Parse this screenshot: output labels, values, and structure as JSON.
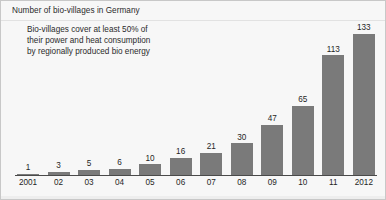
{
  "chart_data": {
    "type": "bar",
    "title": "Number of bio-villages in Germany",
    "annotation_lines": [
      "Bio-villages cover at least 50% of",
      "their power and heat consumption",
      "by regionally produced bio energy"
    ],
    "categories": [
      "2001",
      "02",
      "03",
      "04",
      "05",
      "06",
      "07",
      "08",
      "09",
      "10",
      "11",
      "2012"
    ],
    "values": [
      1,
      3,
      5,
      6,
      10,
      16,
      21,
      30,
      47,
      65,
      113,
      133
    ],
    "xlabel": "",
    "ylabel": "",
    "ylim": [
      0,
      133
    ],
    "grid": false,
    "legend": null,
    "bar_color": "#7a7a7a",
    "background_color": "#f7f7f7",
    "axis_color": "#4a4a4a",
    "text_color": "#1f1f1f"
  }
}
